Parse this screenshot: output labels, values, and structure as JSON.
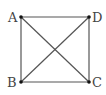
{
  "diagram": {
    "type": "square-with-diagonals",
    "line_color": "#555555",
    "point_color": "#111111",
    "points": [
      {
        "label": "A",
        "x": 21,
        "y": 17,
        "lx": 8,
        "ly": 22
      },
      {
        "label": "D",
        "x": 89,
        "y": 17,
        "lx": 92,
        "ly": 22
      },
      {
        "label": "B",
        "x": 21,
        "y": 82,
        "lx": 7,
        "ly": 87
      },
      {
        "label": "C",
        "x": 89,
        "y": 82,
        "lx": 92,
        "ly": 87
      }
    ],
    "segments": [
      [
        "A",
        "D"
      ],
      [
        "D",
        "C"
      ],
      [
        "C",
        "B"
      ],
      [
        "B",
        "A"
      ],
      [
        "A",
        "C"
      ],
      [
        "B",
        "D"
      ]
    ]
  }
}
